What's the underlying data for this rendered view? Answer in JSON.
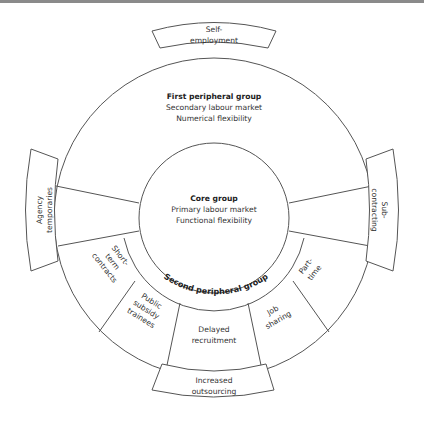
{
  "diagram": {
    "type": "flexible-firm-model",
    "core": {
      "title": "Core group",
      "line1": "Primary labour market",
      "line2": "Functional flexibility"
    },
    "first_peripheral": {
      "title": "First peripheral group",
      "line1": "Secondary labour market",
      "line2": "Numerical flexibility"
    },
    "second_peripheral": {
      "title": "Second peripheral group",
      "segments": [
        {
          "line1": "Short-",
          "line2": "term",
          "line3": "contracts"
        },
        {
          "line1": "Public",
          "line2": "subsidy",
          "line3": "trainees"
        },
        {
          "line1": "Delayed",
          "line2": "recruitment"
        },
        {
          "line1": "Job",
          "line2": "sharing"
        },
        {
          "line1": "Part-",
          "line2": "time"
        }
      ]
    },
    "external": {
      "top": {
        "line1": "Self-",
        "line2": "employment"
      },
      "left": {
        "line1": "Agency",
        "line2": "temporaries"
      },
      "right": {
        "line1": "Sub-",
        "line2": "contracting"
      },
      "bottom": {
        "line1": "Increased",
        "line2": "outsourcing"
      }
    }
  }
}
